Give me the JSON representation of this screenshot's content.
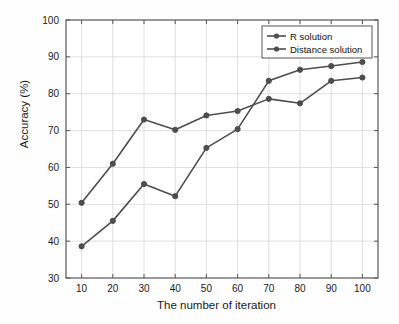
{
  "chart_data": {
    "type": "line",
    "title": "",
    "xlabel": "The number of iteration",
    "ylabel": "Accuracy (%)",
    "x": [
      10,
      20,
      30,
      40,
      50,
      60,
      70,
      80,
      90,
      100
    ],
    "xlim": [
      5,
      105
    ],
    "ylim": [
      30,
      100
    ],
    "xticks": [
      10,
      20,
      30,
      40,
      50,
      60,
      70,
      80,
      90,
      100
    ],
    "yticks": [
      30,
      40,
      50,
      60,
      70,
      80,
      90,
      100
    ],
    "xtick_labels": [
      "10",
      "20",
      "30",
      "40",
      "50",
      "60",
      "70",
      "80",
      "90",
      "100"
    ],
    "ytick_labels": [
      "30",
      "40",
      "50",
      "60",
      "70",
      "80",
      "90",
      "100"
    ],
    "grid": true,
    "legend_position": "top-right",
    "series": [
      {
        "name": "R solution",
        "color": "#4d4d4d",
        "marker": "circle",
        "values": [
          50.4,
          61.0,
          73.0,
          70.2,
          74.1,
          75.3,
          78.6,
          77.4,
          83.5,
          84.4
        ]
      },
      {
        "name": "Distance solution",
        "color": "#4d4d4d",
        "marker": "circle",
        "values": [
          38.6,
          45.5,
          55.5,
          52.2,
          65.3,
          70.4,
          83.5,
          86.5,
          87.5,
          88.6
        ]
      }
    ]
  },
  "axes": {
    "frame_color": "#555555",
    "grid_color": "#d8d8d8",
    "background": "#ffffff"
  },
  "legend": {
    "entries": [
      "R solution",
      "Distance solution"
    ],
    "border_color": "#555555",
    "background": "#ffffff"
  }
}
